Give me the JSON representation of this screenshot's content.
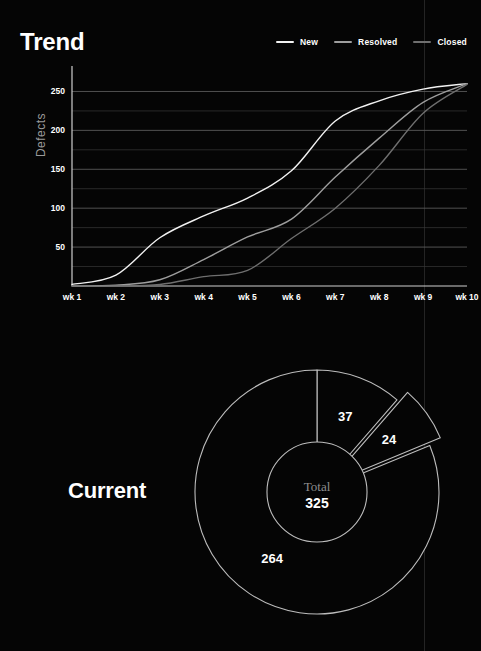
{
  "page": {
    "background": "#050505",
    "divider_color": "#242424"
  },
  "trend": {
    "title": "Trend",
    "y_axis_label": "Defects",
    "legend": [
      {
        "label": "New",
        "color": "#f2f2f2"
      },
      {
        "label": "Resolved",
        "color": "#9e9e9e"
      },
      {
        "label": "Closed",
        "color": "#6f6f6f"
      }
    ]
  },
  "current": {
    "title": "Current",
    "center_caption": "Total",
    "center_value": "325"
  },
  "chart_data": [
    {
      "type": "line",
      "title": "Trend",
      "xlabel": "",
      "ylabel": "Defects",
      "grid": true,
      "legend_position": "top-right",
      "categories": [
        "wk 1",
        "wk 2",
        "wk 3",
        "wk 4",
        "wk 5",
        "wk 6",
        "wk 7",
        "wk 8",
        "wk 9",
        "wk 10"
      ],
      "x": [
        1,
        2,
        3,
        4,
        5,
        6,
        7,
        8,
        9,
        10
      ],
      "ylim": [
        0,
        275
      ],
      "yticks": [
        50,
        100,
        150,
        200,
        250
      ],
      "series": [
        {
          "name": "New",
          "color": "#f2f2f2",
          "values": [
            2,
            14,
            62,
            90,
            113,
            148,
            212,
            238,
            253,
            260
          ]
        },
        {
          "name": "Resolved",
          "color": "#9e9e9e",
          "values": [
            0,
            1,
            8,
            34,
            63,
            86,
            140,
            190,
            236,
            260
          ]
        },
        {
          "name": "Closed",
          "color": "#6f6f6f",
          "values": [
            0,
            0,
            2,
            12,
            20,
            61,
            100,
            155,
            222,
            259
          ]
        }
      ]
    },
    {
      "type": "pie",
      "title": "Current",
      "total": 325,
      "center_label": "Total",
      "center_value": 325,
      "labels": [
        "37",
        "24",
        "264"
      ],
      "values": [
        37,
        24,
        264
      ],
      "exploded_index": 1,
      "donut": true,
      "inner_radius_ratio": 0.41,
      "stroke_color": "#bdbdbd"
    }
  ]
}
